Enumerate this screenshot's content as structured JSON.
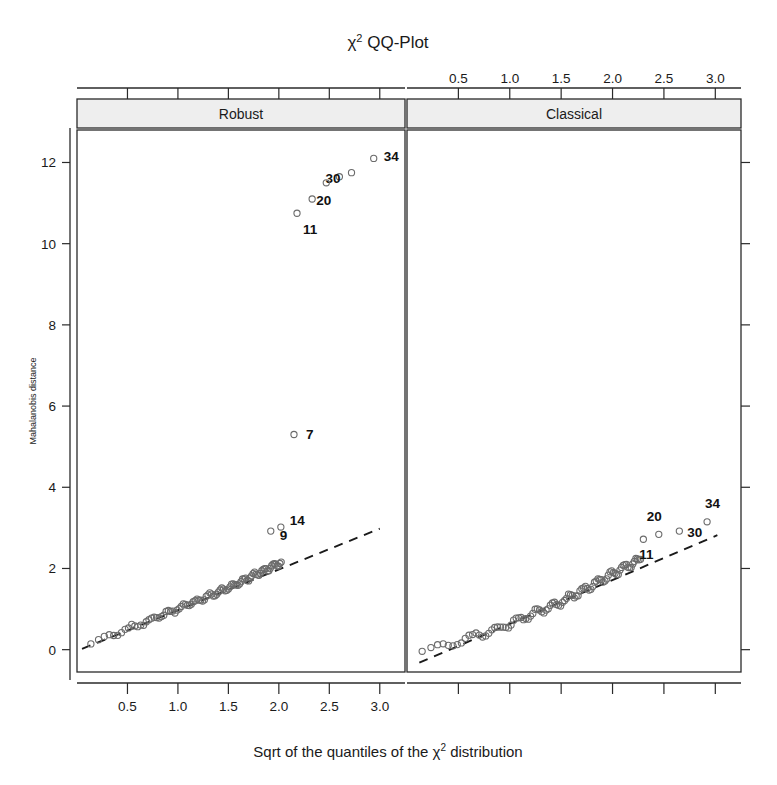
{
  "chart_data": {
    "type": "scatter",
    "xlabel": "Sqrt of the quantiles of the χ² distribution",
    "ylabel": "Mahalanobis distance",
    "xlim": [
      0,
      3.25
    ],
    "ylim": [
      -0.55,
      12.8
    ],
    "xticks": [
      0.5,
      1.0,
      1.5,
      2.0,
      2.5,
      3.0
    ],
    "xtick_labels": [
      "0.5",
      "1.0",
      "1.5",
      "2.0",
      "2.5",
      "3.0"
    ],
    "yticks": [
      0,
      2,
      4,
      6,
      8,
      10,
      12
    ],
    "ytick_labels": [
      "0",
      "2",
      "4",
      "6",
      "8",
      "10",
      "12"
    ],
    "grid": false,
    "legend": "none",
    "panel_layout": "two-panel-horizontal",
    "panels": [
      {
        "name": "robust",
        "strip_label": "Robust",
        "bottom_axis_labeled": true,
        "top_axis_labeled": false,
        "reference_line": {
          "style": "dashed",
          "x": [
            0.05,
            3.0
          ],
          "y": [
            0.02,
            2.98
          ],
          "slope": 1.0,
          "intercept": 0.0
        },
        "labeled_points": [
          {
            "label": "34",
            "x": 2.94,
            "y": 12.1,
            "label_dx": 10,
            "label_dy": 3
          },
          {
            "label": "30",
            "x": 2.72,
            "y": 11.75,
            "label_dx": -26,
            "label_dy": 10
          },
          {
            "label": "20",
            "x": 2.47,
            "y": 11.5,
            "label_dx": -10,
            "label_dy": 22
          },
          {
            "label": "11",
            "x": 2.18,
            "y": 10.75,
            "label_dx": 6,
            "label_dy": 21
          },
          {
            "label": "7",
            "x": 2.15,
            "y": 5.3,
            "label_dx": 12,
            "label_dy": 5
          },
          {
            "label": "14",
            "x": 2.02,
            "y": 3.02,
            "label_dx": 9,
            "label_dy": -2
          },
          {
            "label": "9",
            "x": 1.92,
            "y": 2.92,
            "label_dx": 9,
            "label_dy": 9
          }
        ],
        "extra_upper_points": [
          {
            "x": 2.33,
            "y": 11.1
          },
          {
            "x": 2.6,
            "y": 11.65
          }
        ],
        "cloud_description": "dense band of ~90 open circles rising from (0.08,0.1) to (1.95,2.05) hugging the dashed 1:1 reference line"
      },
      {
        "name": "classical",
        "strip_label": "Classical",
        "bottom_axis_labeled": false,
        "top_axis_labeled": true,
        "reference_line": {
          "style": "dashed",
          "x": [
            0.12,
            3.02
          ],
          "y": [
            -0.32,
            2.82
          ],
          "slope": 1.083,
          "intercept": -0.45
        },
        "labeled_points": [
          {
            "label": "34",
            "x": 2.92,
            "y": 3.15,
            "label_dx": -2,
            "label_dy": -14
          },
          {
            "label": "30",
            "x": 2.65,
            "y": 2.92,
            "label_dx": 8,
            "label_dy": 6
          },
          {
            "label": "20",
            "x": 2.45,
            "y": 2.84,
            "label_dx": -12,
            "label_dy": -13
          },
          {
            "label": "11",
            "x": 2.3,
            "y": 2.72,
            "label_dx": -4,
            "label_dy": 20
          }
        ],
        "cloud_description": "dense band of ~90 open circles rising from (0.1,-0.35) to (2.2,2.62) crossing the dashed reference line near x=1.6"
      }
    ]
  },
  "figure": {
    "background_color": "#ffffff",
    "marker_color": "#6b6b6b",
    "line_color": "#1a1a1a",
    "strip_fill": "#eeeeee",
    "text_color": "#1a1a1a",
    "marker_style": "open-circle",
    "marker_radius": 3.1
  }
}
